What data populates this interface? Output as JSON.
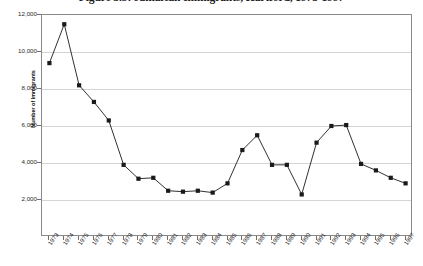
{
  "chart_data": {
    "type": "line",
    "title": "Figure 3.5: Jamaican Immigrants, Hartford, 1973-1997",
    "xlabel": "",
    "ylabel": "Number of Immigrants",
    "ylim": [
      0,
      12000
    ],
    "ytick_labels": [
      "12,000",
      "10,000",
      "8,000",
      "6,000",
      "4,000",
      "2,000"
    ],
    "ytick_values": [
      12000,
      10000,
      8000,
      6000,
      4000,
      2000
    ],
    "grid": true,
    "legend": "none",
    "marker": "square",
    "series_color": "#1a1a1a",
    "categories": [
      "1973",
      "1974",
      "1975",
      "1976",
      "1977",
      "1978",
      "1979",
      "1980",
      "1981",
      "1982",
      "1983",
      "1984",
      "1985",
      "1986",
      "1987",
      "1988",
      "1989",
      "1990",
      "1991",
      "1992",
      "1993",
      "1994",
      "1995",
      "1996",
      "1997"
    ],
    "values": [
      9400,
      11500,
      8200,
      7300,
      6300,
      3900,
      3150,
      3200,
      2500,
      2450,
      2500,
      2400,
      2900,
      4700,
      5500,
      3900,
      3900,
      2300,
      5100,
      6000,
      6050,
      3950,
      3600,
      3200,
      2900
    ]
  }
}
